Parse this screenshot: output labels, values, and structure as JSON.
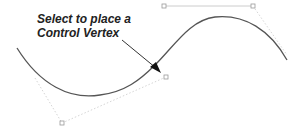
{
  "annotation": {
    "line1": "Select to place a",
    "line2": "Control Vertex"
  },
  "colors": {
    "curve": "#555555",
    "hull": "#cccccc",
    "vertex": "#999999",
    "arrow": "#222222",
    "text": "#222222"
  },
  "control_vertices": [
    {
      "name": "cv-bottom-left"
    },
    {
      "name": "cv-middle"
    },
    {
      "name": "cv-top-left"
    },
    {
      "name": "cv-top-right"
    }
  ]
}
